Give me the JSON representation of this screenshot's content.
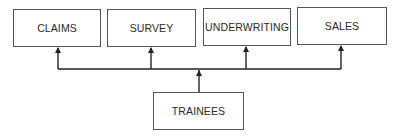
{
  "diagram": {
    "type": "org-chart",
    "departments": [
      {
        "id": "claims",
        "label": "CLAIMS"
      },
      {
        "id": "survey",
        "label": "SURVEY"
      },
      {
        "id": "underwriting",
        "label": "UNDERWRITING"
      },
      {
        "id": "sales",
        "label": "SALES"
      }
    ],
    "source": {
      "id": "trainees",
      "label": "TRAINEES"
    },
    "edges": [
      {
        "from": "trainees",
        "to": "claims"
      },
      {
        "from": "trainees",
        "to": "survey"
      },
      {
        "from": "trainees",
        "to": "underwriting"
      },
      {
        "from": "trainees",
        "to": "sales"
      }
    ],
    "colors": {
      "line": "#222222",
      "border": "#555555",
      "text": "#2a2a2a",
      "background": "#ffffff"
    }
  }
}
